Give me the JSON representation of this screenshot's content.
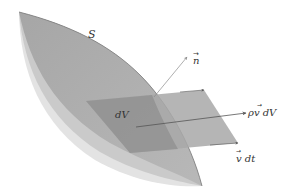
{
  "diagram": {
    "labels": {
      "surface": "S",
      "normal": "n",
      "volume_element": "dV",
      "flux": "ρv dV",
      "displacement": "v dt"
    },
    "colors": {
      "surface_dark": "#a9a9a9",
      "surface_mid": "#c4c4c4",
      "surface_light": "#dedede",
      "volume_element": "#9a9a9a",
      "arrow": "#555555",
      "normal_arrow": "#8c8c8c",
      "text": "#333333"
    }
  }
}
